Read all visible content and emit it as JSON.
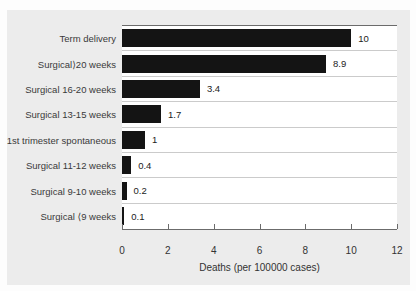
{
  "figure": {
    "panel_bg": "#ececec",
    "plot_bg": "#ffffff",
    "axis_color": "#6b6b6b",
    "separator_color": "#cbcbcb",
    "text_color": "#333333"
  },
  "chart_data": {
    "type": "bar",
    "orientation": "horizontal",
    "title": "",
    "categories": [
      "Term delivery",
      "Surgical⟩20 weeks",
      "Surgical 16-20 weeks",
      "Surgical 13-15 weeks",
      "1st trimester spontaneous",
      "Surgical 11-12 weeks",
      "Surgical 9-10 weeks",
      "Surgical ⟨9 weeks"
    ],
    "values": [
      10,
      8.9,
      3.4,
      1.7,
      1,
      0.4,
      0.2,
      0.1
    ],
    "value_labels": [
      "10",
      "8.9",
      "3.4",
      "1.7",
      "1",
      "0.4",
      "0.2",
      "0.1"
    ],
    "xlabel": "Deaths (per 100000 cases)",
    "xlim": [
      0,
      12
    ],
    "xticks": [
      0,
      2,
      4,
      6,
      8,
      10,
      12
    ],
    "bar_color": "#141414",
    "grid": "row-separator-lines",
    "legend": "none"
  }
}
